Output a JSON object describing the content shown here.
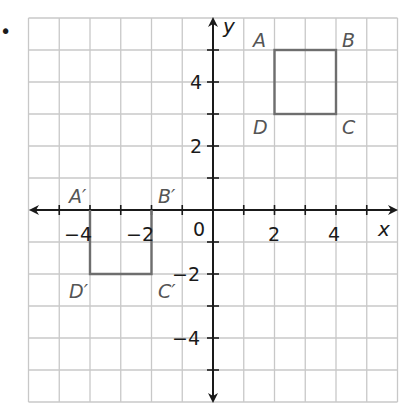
{
  "figure": {
    "marker": "•",
    "axes": {
      "x_label": "x",
      "y_label": "y",
      "origin_label": "0"
    },
    "x_ticks": [
      "−4",
      "−2",
      "2",
      "4"
    ],
    "y_ticks": [
      "4",
      "2",
      "−2",
      "−4"
    ],
    "shapes": {
      "original": {
        "vertices": [
          "A",
          "B",
          "C",
          "D"
        ]
      },
      "image": {
        "vertices": [
          "A′",
          "B′",
          "C′",
          "D′"
        ]
      }
    }
  },
  "chart_data": {
    "type": "diagram",
    "title": "",
    "xlabel": "x",
    "ylabel": "y",
    "xlim": [
      -6,
      6
    ],
    "ylim": [
      -6,
      6
    ],
    "grid": true,
    "x_tick_labels": [
      -4,
      -2,
      2,
      4
    ],
    "y_tick_labels": [
      4,
      2,
      -2,
      -4
    ],
    "polygons": [
      {
        "name": "ABCD",
        "points": {
          "A": [
            2,
            5
          ],
          "B": [
            4,
            5
          ],
          "C": [
            4,
            3
          ],
          "D": [
            2,
            3
          ]
        }
      },
      {
        "name": "A'B'C'D'",
        "points": {
          "A'": [
            -4,
            0
          ],
          "B'": [
            -2,
            0
          ],
          "C'": [
            -2,
            -2
          ],
          "D'": [
            -4,
            -2
          ]
        }
      }
    ]
  },
  "colors": {
    "grid": "#c8c8c8",
    "axis": "#1a1a1a",
    "shape": "#6e6e6e",
    "label": "#555555"
  }
}
